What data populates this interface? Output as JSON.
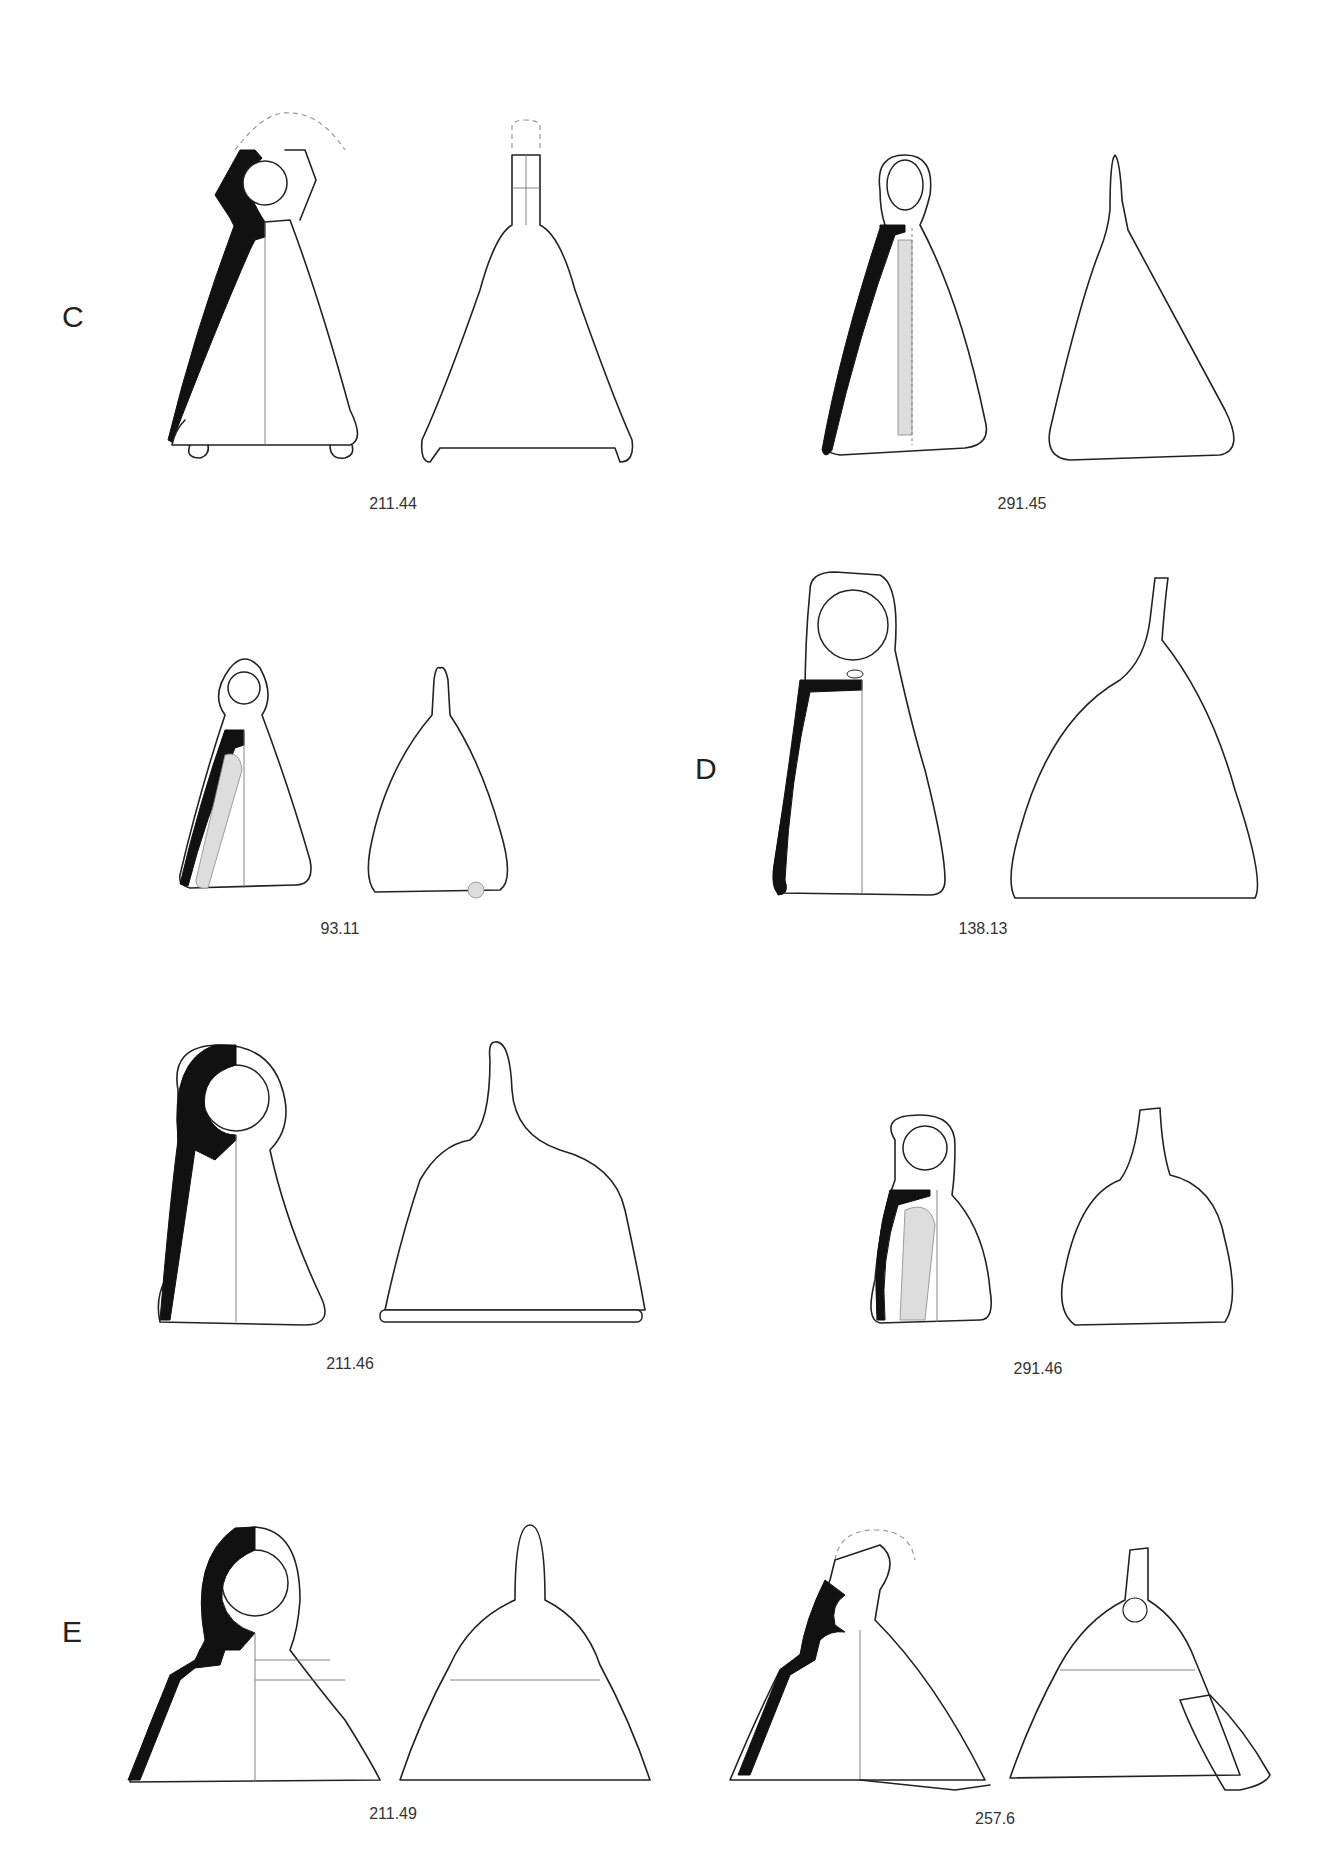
{
  "plate": {
    "groups": [
      {
        "letter": "C",
        "x": 62,
        "y": 300
      },
      {
        "letter": "D",
        "x": 695,
        "y": 752
      },
      {
        "letter": "E",
        "x": 62,
        "y": 1615
      }
    ],
    "items": [
      {
        "label": "211.44",
        "group": "C",
        "x": 393,
        "y": 495
      },
      {
        "label": "291.45",
        "group": "C",
        "x": 1022,
        "y": 495
      },
      {
        "label": "93.11",
        "group": "C",
        "x": 340,
        "y": 920
      },
      {
        "label": "138.13",
        "group": "D",
        "x": 983,
        "y": 920
      },
      {
        "label": "211.46",
        "group": "D",
        "x": 350,
        "y": 1355
      },
      {
        "label": "291.46",
        "group": "D",
        "x": 1038,
        "y": 1360
      },
      {
        "label": "211.49",
        "group": "E",
        "x": 393,
        "y": 1805
      },
      {
        "label": "257.6",
        "group": "E",
        "x": 995,
        "y": 1810
      }
    ]
  },
  "legend": {
    "solid_black": "section profile",
    "stippled": "clapper",
    "dashed": "reconstructed outline"
  }
}
